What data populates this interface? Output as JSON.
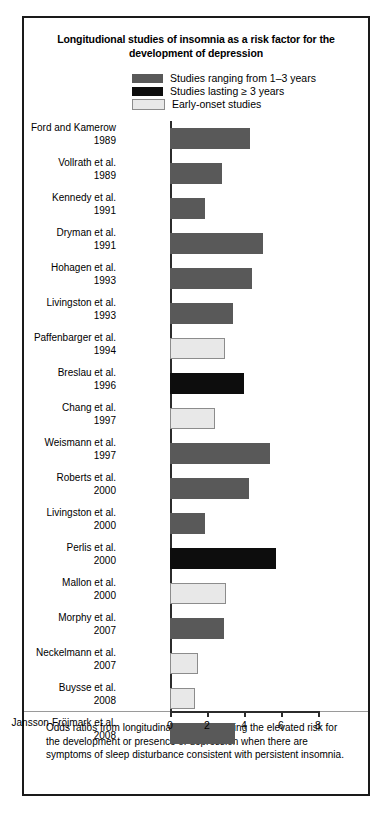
{
  "figure": {
    "title": "Longitudional studies of insomnia as a risk factor for the development of depression",
    "caption": "Odds ratios from longitudinal studies showing the elevated risk for the development or presence of depression when there are symptoms of sleep disturbance consistent with persistent insomnia."
  },
  "colors": {
    "medium_term": "#595959",
    "long_term": "#0d0d0d",
    "early_onset": "#e8e8e8",
    "bar_border": "#8c8c8c",
    "axis": "#2b2b2b",
    "frame": "#1a1a1a"
  },
  "legend": {
    "position": "top-center",
    "entries": [
      {
        "label": "Studies ranging from 1–3 years",
        "color": "#595959",
        "key": "medium_term"
      },
      {
        "label": "Studies lasting ≥ 3 years",
        "color": "#0d0d0d",
        "key": "long_term"
      },
      {
        "label": "Early-onset studies",
        "color": "#e8e8e8",
        "key": "early_onset"
      }
    ]
  },
  "axis": {
    "ticks": [
      "0",
      "2",
      "4",
      "6",
      "8"
    ],
    "tick_values": [
      0,
      2,
      4,
      6,
      8
    ],
    "xlim": [
      0,
      8
    ]
  },
  "chart_data": {
    "type": "bar",
    "orientation": "horizontal",
    "title": "Longitudional studies of insomnia as a risk factor for the development of depression",
    "xlabel": "",
    "ylabel": "",
    "xlim": [
      0,
      8
    ],
    "grid": false,
    "legend_position": "top-center",
    "categories": [
      "Ford and Kamerow 1989",
      "Vollrath et al. 1989",
      "Kennedy et al. 1991",
      "Dryman et al. 1991",
      "Hohagen et al. 1993",
      "Livingston et al. 1993",
      "Paffenbarger et al. 1994",
      "Breslau et al. 1996",
      "Chang et al. 1997",
      "Weismann et al. 1997",
      "Roberts et al. 2000",
      "Livingston et al. 2000",
      "Perlis et al. 2000",
      "Mallon et al. 2000",
      "Morphy et al. 2007",
      "Neckelmann et al. 2007",
      "Buysse et al. 2008",
      "Jansson-Fröjmark et al. 2008"
    ],
    "values": [
      4.3,
      2.8,
      1.9,
      5.0,
      4.45,
      3.4,
      2.95,
      4.0,
      2.45,
      5.4,
      4.25,
      1.9,
      5.75,
      3.0,
      2.9,
      1.5,
      1.35,
      3.5
    ],
    "bars": [
      {
        "author": "Ford and Kamerow",
        "year": "1989",
        "value": 4.3,
        "group": "medium_term"
      },
      {
        "author": "Vollrath et al.",
        "year": "1989",
        "value": 2.8,
        "group": "medium_term"
      },
      {
        "author": "Kennedy et al.",
        "year": "1991",
        "value": 1.9,
        "group": "medium_term"
      },
      {
        "author": "Dryman et al.",
        "year": "1991",
        "value": 5.0,
        "group": "medium_term"
      },
      {
        "author": "Hohagen et al.",
        "year": "1993",
        "value": 4.45,
        "group": "medium_term"
      },
      {
        "author": "Livingston et al.",
        "year": "1993",
        "value": 3.4,
        "group": "medium_term"
      },
      {
        "author": "Paffenbarger et al.",
        "year": "1994",
        "value": 2.95,
        "group": "early_onset"
      },
      {
        "author": "Breslau et al.",
        "year": "1996",
        "value": 4.0,
        "group": "long_term"
      },
      {
        "author": "Chang et al.",
        "year": "1997",
        "value": 2.45,
        "group": "early_onset"
      },
      {
        "author": "Weismann et al.",
        "year": "1997",
        "value": 5.4,
        "group": "medium_term"
      },
      {
        "author": "Roberts et al.",
        "year": "2000",
        "value": 4.25,
        "group": "medium_term"
      },
      {
        "author": "Livingston et al.",
        "year": "2000",
        "value": 1.9,
        "group": "medium_term"
      },
      {
        "author": "Perlis et al.",
        "year": "2000",
        "value": 5.75,
        "group": "long_term"
      },
      {
        "author": "Mallon et al.",
        "year": "2000",
        "value": 3.0,
        "group": "early_onset"
      },
      {
        "author": "Morphy et al.",
        "year": "2007",
        "value": 2.9,
        "group": "medium_term"
      },
      {
        "author": "Neckelmann et al.",
        "year": "2007",
        "value": 1.5,
        "group": "early_onset"
      },
      {
        "author": "Buysse et al.",
        "year": "2008",
        "value": 1.35,
        "group": "early_onset"
      },
      {
        "author": "Jansson-Fröjmark et al.",
        "year": "2008",
        "value": 3.5,
        "group": "medium_term"
      }
    ]
  }
}
